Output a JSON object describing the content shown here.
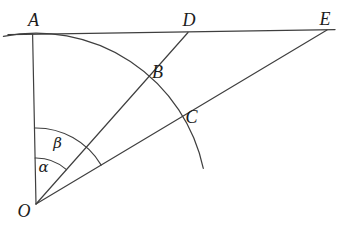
{
  "figure": {
    "background_color": "#ffffff",
    "line_color": "#3f3f3f",
    "text_color": "#1c1c1c",
    "point_labels": {
      "A": "A",
      "B": "B",
      "C": "C",
      "D": "D",
      "E": "E",
      "O": "O"
    },
    "angle_labels": {
      "alpha": "α",
      "beta": "β"
    }
  }
}
